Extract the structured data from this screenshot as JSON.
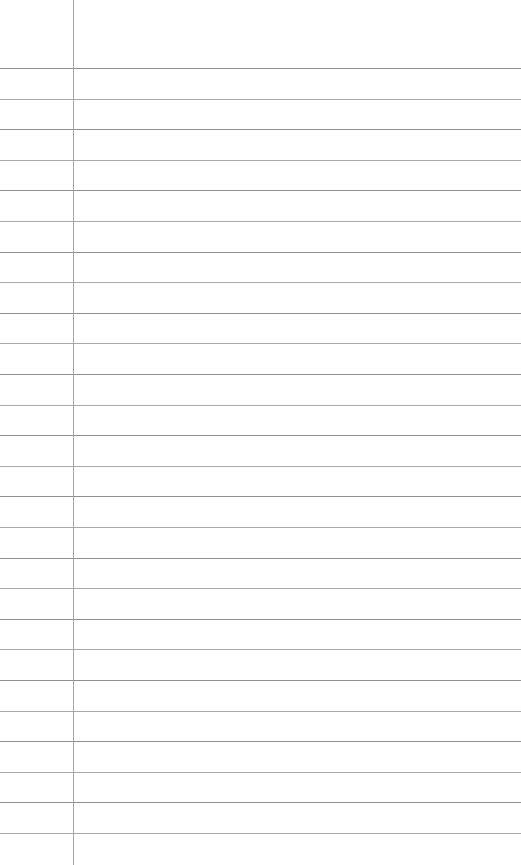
{
  "document": {
    "kind": "lined-notebook-paper",
    "title": "Blank Ruled Page",
    "page_width": 521,
    "page_height": 865,
    "background_color": "#ffffff",
    "orientation": "portrait"
  },
  "ruling": {
    "style": "wide-ruled-with-margin",
    "line_color": "#85868a",
    "line_alt_color": "#9a9b9f",
    "line_thickness_px": 1,
    "line_count": 26,
    "first_line_y": 68,
    "line_spacing_px": 30.6,
    "line_start_x": 0,
    "line_end_x": 521,
    "line_positions": [
      68,
      98.6,
      129.2,
      159.8,
      190.4,
      221,
      251.6,
      282.2,
      312.8,
      343.4,
      374,
      404.6,
      435.2,
      465.8,
      496.4,
      527,
      557.6,
      588.2,
      618.8,
      649.4,
      680,
      710.6,
      741.2,
      771.8,
      802.4,
      833
    ]
  },
  "margin_rule": {
    "label": "vertical-margin-rule",
    "color": "#9b9c9f",
    "thickness_px": 1,
    "x": 73,
    "top_y": 0,
    "bottom_y": 865
  },
  "content": {
    "has_handwriting": false,
    "has_typed_text": false,
    "rows": [
      {
        "margin": "",
        "body": ""
      },
      {
        "margin": "",
        "body": ""
      },
      {
        "margin": "",
        "body": ""
      },
      {
        "margin": "",
        "body": ""
      },
      {
        "margin": "",
        "body": ""
      },
      {
        "margin": "",
        "body": ""
      },
      {
        "margin": "",
        "body": ""
      },
      {
        "margin": "",
        "body": ""
      },
      {
        "margin": "",
        "body": ""
      },
      {
        "margin": "",
        "body": ""
      },
      {
        "margin": "",
        "body": ""
      },
      {
        "margin": "",
        "body": ""
      },
      {
        "margin": "",
        "body": ""
      },
      {
        "margin": "",
        "body": ""
      },
      {
        "margin": "",
        "body": ""
      },
      {
        "margin": "",
        "body": ""
      },
      {
        "margin": "",
        "body": ""
      },
      {
        "margin": "",
        "body": ""
      },
      {
        "margin": "",
        "body": ""
      },
      {
        "margin": "",
        "body": ""
      },
      {
        "margin": "",
        "body": ""
      },
      {
        "margin": "",
        "body": ""
      },
      {
        "margin": "",
        "body": ""
      },
      {
        "margin": "",
        "body": ""
      },
      {
        "margin": "",
        "body": ""
      },
      {
        "margin": "",
        "body": ""
      }
    ]
  }
}
